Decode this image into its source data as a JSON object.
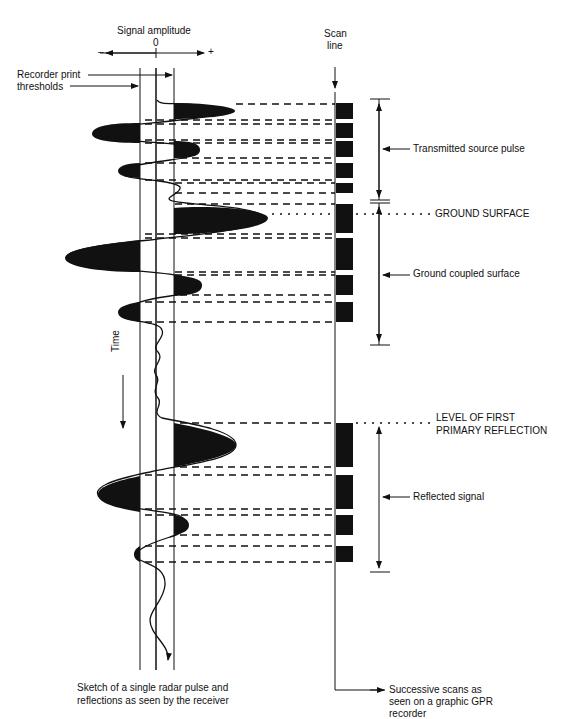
{
  "labels": {
    "signal_amplitude": "Signal amplitude",
    "zero": "0",
    "minus": "–",
    "plus": "+",
    "recorder_print_line1": "Recorder print",
    "recorder_print_line2": "thresholds",
    "scan_line1": "Scan",
    "scan_line2": "line",
    "transmitted_source_pulse": "Transmitted source pulse",
    "ground_surface": "GROUND SURFACE",
    "ground_coupled_surface": "Ground coupled surface",
    "time": "Time",
    "level_first_line1": "LEVEL OF FIRST",
    "level_first_line2": "PRIMARY REFLECTION",
    "reflected_signal": "Reflected signal",
    "sketch_line1": "Sketch of a single radar pulse and",
    "sketch_line2": "reflections as seen by the receiver",
    "successive_line1": "Successive scans as",
    "successive_line2": "seen on a graphic GPR",
    "successive_line3": "recorder"
  },
  "colors": {
    "ink": "#111111",
    "background": "#ffffff"
  }
}
